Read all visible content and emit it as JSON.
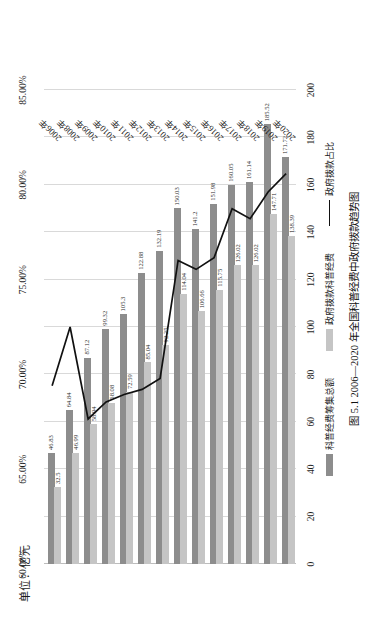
{
  "figure": {
    "unit_label": "单位：亿元",
    "caption": "图 5.1  2006—2020 年全国科普经费中政府拨款趋势图"
  },
  "legend": {
    "items": [
      {
        "label": "科普经费筹集总额",
        "marker": "bar-dark",
        "color": "#8d8d8d"
      },
      {
        "label": "政府拨款科普经费",
        "marker": "bar-light",
        "color": "#c5c5c5"
      },
      {
        "label": "政府拨款占比",
        "marker": "line",
        "color": "#111111"
      }
    ]
  },
  "chart_data": {
    "type": "bar",
    "title": "图 5.1  2006—2020 年全国科普经费中政府拨款趋势图",
    "xlabel": "",
    "ylabel": "单位：亿元",
    "orientation": "vertical",
    "grid": true,
    "legend_position": "bottom",
    "categories": [
      "2006年",
      "2008年",
      "2009年",
      "2010年",
      "2011年",
      "2012年",
      "2013年",
      "2014年",
      "2015年",
      "2016年",
      "2017年",
      "2018年",
      "2019年",
      "2020年"
    ],
    "series": [
      {
        "name": "科普经费筹集总额",
        "type": "bar",
        "color": "#8d8d8d",
        "values": [
          46.83,
          64.84,
          87.12,
          99.32,
          105.3,
          122.88,
          132.19,
          150.03,
          141.2,
          151.98,
          160.05,
          161.14,
          185.52,
          171.72
        ]
      },
      {
        "name": "政府拨款科普经费",
        "type": "bar",
        "color": "#c5c5c5",
        "values": [
          32.5,
          46.99,
          58.94,
          68.08,
          72.59,
          85.04,
          92.25,
          114.04,
          106.66,
          115.75,
          126.02,
          126.02,
          147.71,
          138.39
        ]
      },
      {
        "name": "政府拨款占比",
        "type": "line",
        "color": "#111111",
        "axis": "secondary",
        "values": [
          69.4,
          72.5,
          67.65,
          68.55,
          68.94,
          69.21,
          69.79,
          76.01,
          75.54,
          76.16,
          78.74,
          78.21,
          79.62,
          80.59
        ]
      }
    ],
    "value_axis": {
      "ticks": [
        0,
        20,
        40,
        60,
        80,
        100,
        120,
        140,
        160,
        180,
        200
      ],
      "min": 0,
      "max": 200
    },
    "percent_axis": {
      "ticks": [
        "60.00%",
        "65.00%",
        "70.00%",
        "75.00%",
        "80.00%",
        "85.00%"
      ],
      "min": 60,
      "max": 85
    }
  }
}
